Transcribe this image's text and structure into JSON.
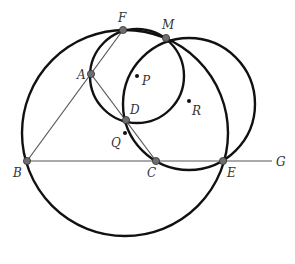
{
  "diagram": {
    "colors": {
      "stroke": "#111111",
      "line": "#555555",
      "point_fill": "#6e6e6e",
      "label": "#333333"
    },
    "circles": [
      {
        "name": "big-circle-Q",
        "cx": 125,
        "cy": 133,
        "r": 103
      },
      {
        "name": "circle-P",
        "cx": 137,
        "cy": 76,
        "r": 47
      },
      {
        "name": "circle-R",
        "cx": 189,
        "cy": 104,
        "r": 66
      }
    ],
    "segments": [
      {
        "name": "line-BG",
        "x1": 27,
        "y1": 161,
        "x2": 272,
        "y2": 161
      },
      {
        "name": "segment-BF",
        "x1": 27,
        "y1": 161,
        "x2": 123,
        "y2": 30
      },
      {
        "name": "segment-AC",
        "x1": 91,
        "y1": 74,
        "x2": 156,
        "y2": 161
      }
    ],
    "points": [
      {
        "id": "F",
        "x": 123,
        "y": 30,
        "lx": 118,
        "ly": 22,
        "large": true
      },
      {
        "id": "M",
        "x": 166,
        "y": 38,
        "lx": 162,
        "ly": 29,
        "large": true
      },
      {
        "id": "A",
        "x": 91,
        "y": 74,
        "lx": 77,
        "ly": 79,
        "large": true
      },
      {
        "id": "D",
        "x": 126,
        "y": 120,
        "lx": 130,
        "ly": 114,
        "large": true
      },
      {
        "id": "B",
        "x": 27,
        "y": 161,
        "lx": 13,
        "ly": 177,
        "large": true
      },
      {
        "id": "C",
        "x": 156,
        "y": 161,
        "lx": 147,
        "ly": 177,
        "large": true
      },
      {
        "id": "E",
        "x": 223,
        "y": 161,
        "lx": 227,
        "ly": 177,
        "large": true
      },
      {
        "id": "P",
        "x": 137,
        "y": 76,
        "lx": 142,
        "ly": 85,
        "large": false
      },
      {
        "id": "Q",
        "x": 125,
        "y": 133,
        "lx": 111,
        "ly": 147,
        "large": false
      },
      {
        "id": "R",
        "x": 189,
        "y": 101,
        "lx": 192,
        "ly": 115,
        "large": false
      },
      {
        "id": "G",
        "x": 272,
        "y": 161,
        "lx": 276,
        "ly": 166,
        "large": false,
        "no_dot": true
      }
    ]
  }
}
